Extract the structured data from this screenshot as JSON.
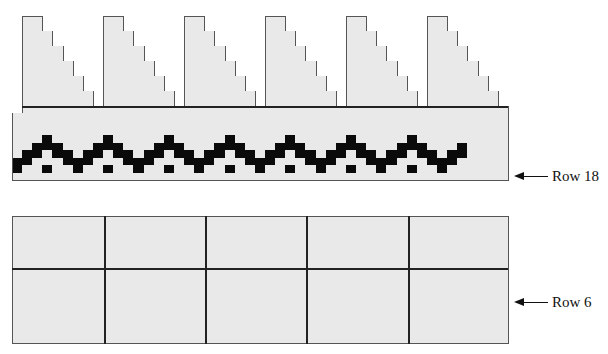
{
  "figure": {
    "type": "knitting-chart",
    "colors": {
      "background": "#e9e9e9",
      "grid_line": "#555555",
      "contrast_stitch": "#0a0a0a"
    }
  },
  "upper_chart": {
    "columns": 49,
    "triangles": {
      "count": 6,
      "start_columns": [
        1,
        9,
        17,
        25,
        33,
        41
      ],
      "widths_by_row_pair": [
        2,
        3,
        4,
        5,
        6,
        7
      ]
    },
    "band_rows": 9,
    "zigzag": {
      "period": 6,
      "first_peak_column": 3,
      "last_column": 44
    },
    "row_label": {
      "text": "Row 18"
    }
  },
  "lower_chart": {
    "columns": 49,
    "rows": 17,
    "thick_row_after": 7,
    "thick_column_every": 10,
    "row_label": {
      "text": "Row 6"
    }
  }
}
